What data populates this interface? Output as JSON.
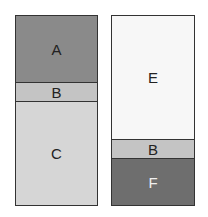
{
  "columns": [
    {
      "segments": [
        {
          "label": "A",
          "color": "#8a8a8a",
          "text_color": "#222222",
          "height": 66
        },
        {
          "label": "B",
          "color": "#c4c4c4",
          "text_color": "#222222",
          "height": 19
        },
        {
          "label": "C",
          "color": "#d6d6d6",
          "text_color": "#222222",
          "height": 105
        }
      ]
    },
    {
      "segments": [
        {
          "label": "E",
          "color": "#f7f7f7",
          "text_color": "#222222",
          "height": 123
        },
        {
          "label": "B",
          "color": "#c4c4c4",
          "text_color": "#222222",
          "height": 19
        },
        {
          "label": "F",
          "color": "#6e6e6e",
          "text_color": "#f0f0f0",
          "height": 48
        }
      ]
    }
  ]
}
